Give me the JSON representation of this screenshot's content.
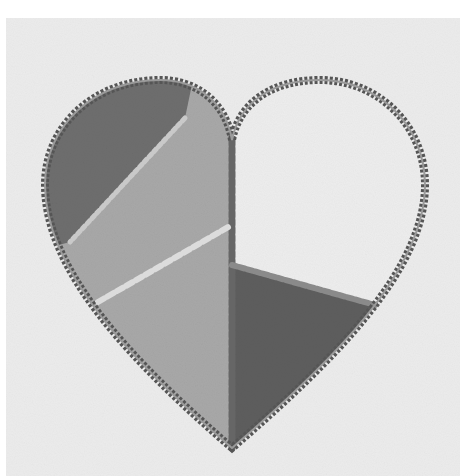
{
  "image": {
    "description": "Photograph of an embroidered patchwork heart appliqué on light fabric, grayscale",
    "subject": "patchwork heart",
    "colors": {
      "background_border": "#ffffff",
      "fabric": "#ececec",
      "patch_dark_top_left": "#6e6e6e",
      "patch_medium_left": "#a8a8a8",
      "patch_light_top_right": "#ededed",
      "patch_dark_bottom_right": "#5e5e5e",
      "outline_stitch": "#555555",
      "decorative_stitch": "#d8d8d8"
    },
    "patches": [
      {
        "name": "top-left-lobe",
        "tone": "dark"
      },
      {
        "name": "left-center",
        "tone": "medium"
      },
      {
        "name": "top-right-lobe",
        "tone": "light"
      },
      {
        "name": "bottom-right",
        "tone": "dark"
      }
    ]
  }
}
